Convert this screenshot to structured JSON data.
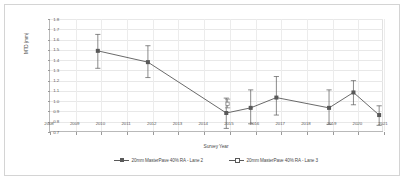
{
  "chart_data": {
    "type": "line",
    "title": "",
    "xlabel": "Survey Year",
    "ylabel": "MTD (mm)",
    "xlim": [
      2008,
      2021
    ],
    "ylim": [
      0.7,
      1.8
    ],
    "grid": true,
    "legend_position": "bottom",
    "x_ticks": [
      2008,
      2009,
      2010,
      2011,
      2012,
      2013,
      2014,
      2015,
      2016,
      2017,
      2018,
      2019,
      2020,
      2021
    ],
    "y_ticks": [
      0.7,
      0.8,
      0.9,
      1.0,
      1.1,
      1.2,
      1.3,
      1.4,
      1.5,
      1.6,
      1.7,
      1.8
    ],
    "y_tick_labels": [
      "0.7",
      "0.8",
      "0.9",
      "1.0",
      "1.1",
      "1.2",
      "1.3",
      "1.4",
      "1.5",
      "1.6",
      "1.7",
      "1.8"
    ],
    "x_tick_labels": [
      "2008",
      "2009",
      "2010",
      "2011",
      "2012",
      "2013",
      "2014",
      "2015",
      "2016",
      "2017",
      "2018",
      "2019",
      "2020",
      "2021"
    ],
    "series": [
      {
        "name": "20mm MasterPave 40% RA - Lane 2",
        "marker": "filled-square",
        "line": "solid",
        "color": "#595959",
        "points": [
          {
            "x": 2009.9,
            "y": 1.49,
            "yerr_low": 1.32,
            "yerr_high": 1.65
          },
          {
            "x": 2011.85,
            "y": 1.38,
            "yerr_low": 1.23,
            "yerr_high": 1.54
          },
          {
            "x": 2014.9,
            "y": 0.885,
            "yerr_low": 0.735,
            "yerr_high": 1.03
          },
          {
            "x": 2015.85,
            "y": 0.935,
            "yerr_low": 0.78,
            "yerr_high": 1.11
          },
          {
            "x": 2016.85,
            "y": 1.035,
            "yerr_low": 0.865,
            "yerr_high": 1.24
          },
          {
            "x": 2018.9,
            "y": 0.935,
            "yerr_low": 0.775,
            "yerr_high": 1.11
          },
          {
            "x": 2019.85,
            "y": 1.085,
            "yerr_low": 0.965,
            "yerr_high": 1.2
          },
          {
            "x": 2020.85,
            "y": 0.865,
            "yerr_low": 0.765,
            "yerr_high": 0.955
          }
        ]
      },
      {
        "name": "20mm MasterPave 40% RA - Lane 3",
        "marker": "hollow-square",
        "line": "solid",
        "color": "#7a7a7a",
        "points": [
          {
            "x": 2014.95,
            "y": 0.975,
            "yerr_low": 0.935,
            "yerr_high": 1.02
          }
        ]
      }
    ]
  },
  "legend": {
    "entries": [
      {
        "label": "20mm MasterPave 40% RA - Lane 2",
        "marker": "filled-square"
      },
      {
        "label": "20mm MasterPave 40% RA - Lane 3",
        "marker": "hollow-square"
      }
    ]
  }
}
